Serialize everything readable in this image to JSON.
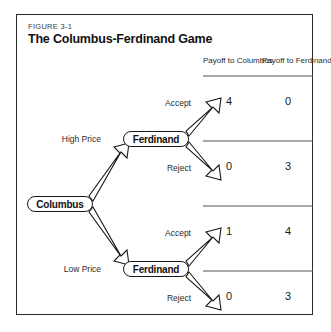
{
  "figure": {
    "label": "FIGURE 3-1",
    "title": "The Columbus-Ferdinand Game"
  },
  "columns": {
    "payoff_columbus": "Payoff to Columbus",
    "payoff_ferdinand": "Payoff to Ferdinand"
  },
  "nodes": {
    "root": "Columbus",
    "ferdinand_high": "Ferdinand",
    "ferdinand_low": "Ferdinand"
  },
  "branches": {
    "high_price": "High Price",
    "low_price": "Low Price",
    "accept_high": "Accept",
    "reject_high": "Reject",
    "accept_low": "Accept",
    "reject_low": "Reject"
  },
  "outcomes": [
    {
      "path": "High Price / Accept",
      "payoff_columbus": "4",
      "payoff_ferdinand": "0"
    },
    {
      "path": "High Price / Reject",
      "payoff_columbus": "0",
      "payoff_ferdinand": "3"
    },
    {
      "path": "Low Price / Accept",
      "payoff_columbus": "1",
      "payoff_ferdinand": "4"
    },
    {
      "path": "Low Price / Reject",
      "payoff_columbus": "0",
      "payoff_ferdinand": "3"
    }
  ],
  "colors": {
    "border": "#2b2b2b",
    "text": "#111111",
    "rule": "#555555"
  }
}
